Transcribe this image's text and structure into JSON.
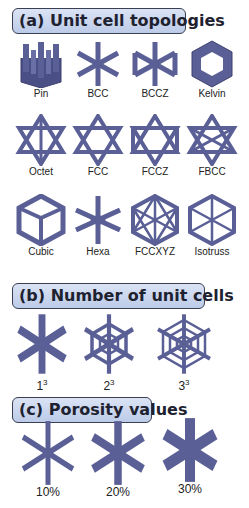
{
  "colors": {
    "strut": "#5a5f96",
    "strut_dark": "#3d4170",
    "header_bg": "#c9d5ee",
    "header_border": "#3a3f52"
  },
  "sections": {
    "a": {
      "title": "(a) Unit cell topologies",
      "items": [
        {
          "label": "Pin"
        },
        {
          "label": "BCC"
        },
        {
          "label": "BCCZ"
        },
        {
          "label": "Kelvin"
        },
        {
          "label": "Octet"
        },
        {
          "label": "FCC"
        },
        {
          "label": "FCCZ"
        },
        {
          "label": "FBCC"
        },
        {
          "label": "Cubic"
        },
        {
          "label": "Hexa"
        },
        {
          "label": "FCCXYZ"
        },
        {
          "label": "Isotruss"
        }
      ]
    },
    "b": {
      "title": "(b) Number of unit cells",
      "items": [
        {
          "base": "1",
          "exp": "3"
        },
        {
          "base": "2",
          "exp": "3"
        },
        {
          "base": "3",
          "exp": "3"
        }
      ]
    },
    "c": {
      "title": "(c) Porosity values",
      "items": [
        {
          "label": "10%"
        },
        {
          "label": "20%"
        },
        {
          "label": "30%"
        }
      ]
    }
  }
}
